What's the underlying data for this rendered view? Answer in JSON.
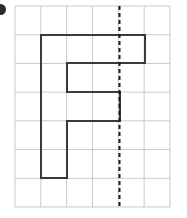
{
  "figure": {
    "kind": "grid-shape-symmetry-figure",
    "bullet_marker": "bullet-dot",
    "grid": {
      "columns": 6,
      "rows": 7,
      "x_start": 15,
      "y_start": 6,
      "cell_width": 25.83,
      "cell_height": 28.71,
      "line_color": "#c9c9c9",
      "line_width": 1
    },
    "shape": {
      "name": "f-shaped-polygon",
      "stroke_color": "#3a3a3a",
      "stroke_width": 2,
      "fill": "none",
      "points": "41,35 145,35 145,63 67,63 67,92 120,92 120,121 67,121 67,178 41,178 41,35"
    },
    "symmetry_line": {
      "name": "vertical-dashed-line",
      "x": 119.5,
      "y_start": 6,
      "y_end": 207,
      "color": "#1a1a1a",
      "width": 2,
      "dash": "4 3"
    }
  }
}
